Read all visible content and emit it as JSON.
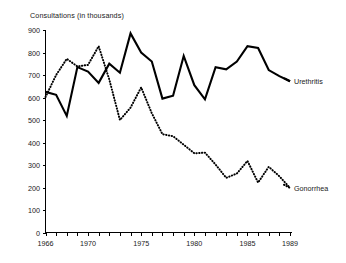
{
  "chart_data": {
    "type": "line",
    "title": "Consultations (in thousands)",
    "xlabel": "",
    "ylabel": "",
    "ylim": [
      0,
      900
    ],
    "ytick_step": 100,
    "yticks": [
      0,
      100,
      200,
      300,
      400,
      500,
      600,
      700,
      800,
      900
    ],
    "xlim": [
      1966,
      1989
    ],
    "xticks_all_years": [
      1966,
      1967,
      1968,
      1969,
      1970,
      1971,
      1972,
      1973,
      1974,
      1975,
      1976,
      1977,
      1978,
      1979,
      1980,
      1981,
      1982,
      1983,
      1984,
      1985,
      1986,
      1987,
      1988,
      1989
    ],
    "xtick_labels": [
      "1966",
      "1970",
      "1975",
      "1980",
      "1985",
      "1989"
    ],
    "xtick_label_years": [
      1966,
      1970,
      1975,
      1980,
      1985,
      1989
    ],
    "grid": false,
    "legend_position": "right-inline",
    "x": [
      1966,
      1967,
      1968,
      1969,
      1970,
      1971,
      1972,
      1973,
      1974,
      1975,
      1976,
      1977,
      1978,
      1979,
      1980,
      1981,
      1982,
      1983,
      1984,
      1985,
      1986,
      1987,
      1988,
      1989
    ],
    "series": [
      {
        "name": "Urethritis",
        "style": "solid",
        "color": "#000000",
        "values": [
          625,
          612,
          518,
          735,
          715,
          665,
          750,
          710,
          885,
          800,
          760,
          595,
          608,
          785,
          655,
          592,
          735,
          725,
          760,
          828,
          820,
          722,
          695,
          672
        ]
      },
      {
        "name": "Gonorrhea",
        "style": "dotted",
        "color": "#000000",
        "values": [
          602,
          700,
          772,
          738,
          745,
          828,
          680,
          500,
          555,
          645,
          530,
          437,
          428,
          390,
          352,
          355,
          302,
          243,
          262,
          318,
          222,
          292,
          250,
          198
        ]
      }
    ],
    "annotations": []
  },
  "labels": {
    "title": "Consultations (in thousands)",
    "series_urethritis": "Urethritis",
    "series_gonorrhea": "Gonorrhea",
    "y_0": "0",
    "y_100": "100",
    "y_200": "200",
    "y_300": "300",
    "y_400": "400",
    "y_500": "500",
    "y_600": "600",
    "y_700": "700",
    "y_800": "800",
    "y_900": "900",
    "x_1966": "1966",
    "x_1970": "1970",
    "x_1975": "1975",
    "x_1980": "1980",
    "x_1985": "1985",
    "x_1989": "1989"
  }
}
